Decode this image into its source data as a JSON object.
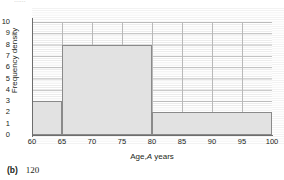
{
  "figure": {
    "top_cut_text": "......",
    "caption_label": "(b)",
    "caption_value": "120"
  },
  "chart_data": {
    "type": "bar",
    "title": "",
    "xlabel_prefix": "Age,",
    "xlabel_italic": "A",
    "xlabel_suffix": "years",
    "ylabel": "Frequency density",
    "categories": [
      "60-65",
      "65-80",
      "80-100"
    ],
    "bins": [
      {
        "label": "60-65",
        "x_start": 60,
        "x_end": 65,
        "frequency_density": 3,
        "frequency": 15
      },
      {
        "label": "65-80",
        "x_start": 65,
        "x_end": 80,
        "frequency_density": 8,
        "frequency": 120
      },
      {
        "label": "80-100",
        "x_start": 80,
        "x_end": 100,
        "frequency_density": 2,
        "frequency": 40
      }
    ],
    "values": [
      3,
      8,
      2
    ],
    "xlim": [
      60,
      100
    ],
    "ylim": [
      0,
      10
    ],
    "x_ticks": [
      60,
      65,
      70,
      75,
      80,
      85,
      90,
      95,
      100
    ],
    "y_ticks": [
      0,
      1,
      2,
      3,
      4,
      5,
      6,
      7,
      8,
      9,
      10
    ],
    "grid": true,
    "minor_grid": true,
    "legend": "none",
    "bar_fill_color": "#e2e2e2",
    "bar_border_color": "#8a8a8a",
    "axis_color": "#6d6d6d",
    "grid_major_color": "#b9b9b9",
    "grid_minor_color": "#e8e8e8"
  }
}
